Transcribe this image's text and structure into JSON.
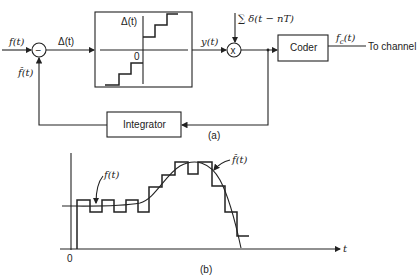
{
  "diagram_a": {
    "caption": "(a)",
    "input_label": "f(t)",
    "error_label": "Δ(t)",
    "feedback_label": "f̂(t)",
    "summer_sign": "−",
    "quantizer": {
      "axis_label": "Δ(t)",
      "origin_label": "0"
    },
    "quantizer_output_label": "y(t)",
    "sampler_symbol": "x",
    "sampling_label": "∑ δ(t − nT)",
    "coder_label": "Coder",
    "coder_output_label": "f_c(t)",
    "coder_output_main": "f",
    "coder_output_sub": "c",
    "coder_output_arg": "(t)",
    "channel_label": "To channel",
    "integrator_label": "Integrator"
  },
  "diagram_b": {
    "caption": "(b)",
    "signal_label": "f(t)",
    "approx_label": "f̂(t)",
    "origin_label": "0",
    "time_axis_label": "t"
  }
}
